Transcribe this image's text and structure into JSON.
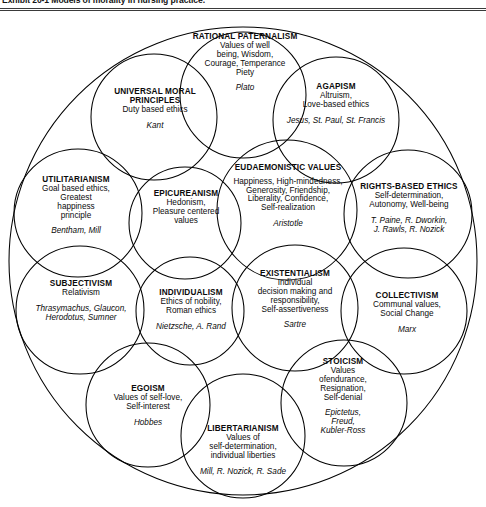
{
  "caption": {
    "label": "Exhibit 20-1  Models of morality in nursing practice."
  },
  "diagram": {
    "kind": "venn-circles",
    "outline_color": "#000000",
    "background_color": "#ffffff",
    "nodes": [
      {
        "id": "rational-paternalism",
        "title": "RATIONAL PATERNALISM",
        "description": "Values  of well being, Wisdom, Courage, Temperance Piety",
        "description_lines": [
          "Values  of well",
          "being, Wisdom,",
          "Courage, Temperance",
          "Piety"
        ],
        "proponents": "Plato",
        "proponent_lines": [
          "Plato"
        ]
      },
      {
        "id": "universal-moral-principles",
        "title": "UNIVERSAL MORAL PRINCIPLES",
        "description": "Duty based ethics",
        "description_lines": [
          "Duty based ethics"
        ],
        "proponents": "Kant",
        "proponent_lines": [
          "Kant"
        ]
      },
      {
        "id": "agapism",
        "title": "AGAPISM",
        "description": "Altruism, Love-based ethics",
        "description_lines": [
          "Altruism,",
          "Love-based ethics"
        ],
        "proponents": "Jesus, St. Paul, St. Francis",
        "proponent_lines": [
          "Jesus, St. Paul, St. Francis"
        ]
      },
      {
        "id": "utilitarianism",
        "title": "UTILITARIANISM",
        "description": "Goal based ethics, Greatest happiness principle",
        "description_lines": [
          "Goal based ethics,",
          "Greatest",
          "happiness",
          "principle"
        ],
        "proponents": "Bentham, Mill",
        "proponent_lines": [
          "Bentham, Mill"
        ]
      },
      {
        "id": "epicureanism",
        "title": "EPICUREANISM",
        "description": "Hedonism, Pleasure centered values",
        "description_lines": [
          "Hedonism,",
          "Pleasure centered",
          "values"
        ],
        "proponents": "",
        "proponent_lines": []
      },
      {
        "id": "eudaemonistic-values",
        "title": "EUDAEMONISTIC VALUES",
        "description": "Happiness, High-mindedness, Generosity, Friendship, Liberality, Confidence, Self-realization",
        "description_lines": [
          "Happiness, High-mindedness,",
          "Generosity, Friendship,",
          "Liberality, Confidence,",
          "Self-realization"
        ],
        "proponents": "Aristotle",
        "proponent_lines": [
          "Aristotle"
        ]
      },
      {
        "id": "rights-based-ethics",
        "title": "RIGHTS-BASED ETHICS",
        "description": "Self-determination, Autonomy, Well-being",
        "description_lines": [
          "Self-determination,",
          "Autonomy, Well-being"
        ],
        "proponents": "T. Paine, R. Dworkin, J. Rawls, R. Nozick",
        "proponent_lines": [
          "T. Paine, R. Dworkin,",
          "J. Rawls, R. Nozick"
        ]
      },
      {
        "id": "subjectivism",
        "title": "SUBJECTIVISM",
        "description": "Relativism",
        "description_lines": [
          "Relativism"
        ],
        "proponents": "Thrasymachus, Glaucon, Herodotus, Sumner",
        "proponent_lines": [
          "Thrasymachus, Glaucon,",
          "Herodotus, Sumner"
        ]
      },
      {
        "id": "individualism",
        "title": "INDIVIDUALISM",
        "description": "Ethics of nobility, Roman ethics",
        "description_lines": [
          "Ethics of nobility,",
          "Roman ethics"
        ],
        "proponents": "Nietzsche, A. Rand",
        "proponent_lines": [
          "Nietzsche, A. Rand"
        ]
      },
      {
        "id": "existentialism",
        "title": "EXISTENTIALISM",
        "description": "Individual decision making and responsibility, Self-assertiveness",
        "description_lines": [
          "Individual",
          "decision making and",
          "responsibility,",
          "Self-assertiveness"
        ],
        "proponents": "Sartre",
        "proponent_lines": [
          "Sartre"
        ]
      },
      {
        "id": "collectivism",
        "title": "COLLECTIVISM",
        "description": "Communal values, Social Change",
        "description_lines": [
          "Communal values,",
          "Social Change"
        ],
        "proponents": "Marx",
        "proponent_lines": [
          "Marx"
        ]
      },
      {
        "id": "egoism",
        "title": "EGOISM",
        "description": "Values of self-love, Self-interest",
        "description_lines": [
          "Values of self-love,",
          "Self-interest"
        ],
        "proponents": "Hobbes",
        "proponent_lines": [
          "Hobbes"
        ]
      },
      {
        "id": "stoicism",
        "title": "STOICISM",
        "description": "Values ofendurance, Resignation, Self-denial",
        "description_lines": [
          "Values",
          "ofendurance,",
          "Resignation,",
          "Self-denial"
        ],
        "proponents": "Epictetus, Freud, Kubler-Ross",
        "proponent_lines": [
          "Epictetus,",
          "Freud,",
          "Kubler-Ross"
        ]
      },
      {
        "id": "libertarianism",
        "title": "LIBERTARIANISM",
        "description": "Values of self-determination, individual liberties",
        "description_lines": [
          "Values of",
          "self-determination,",
          "individual liberties"
        ],
        "proponents": "Mill, R. Nozick, R. Sade",
        "proponent_lines": [
          "Mill, R. Nozick, R. Sade"
        ]
      }
    ]
  }
}
